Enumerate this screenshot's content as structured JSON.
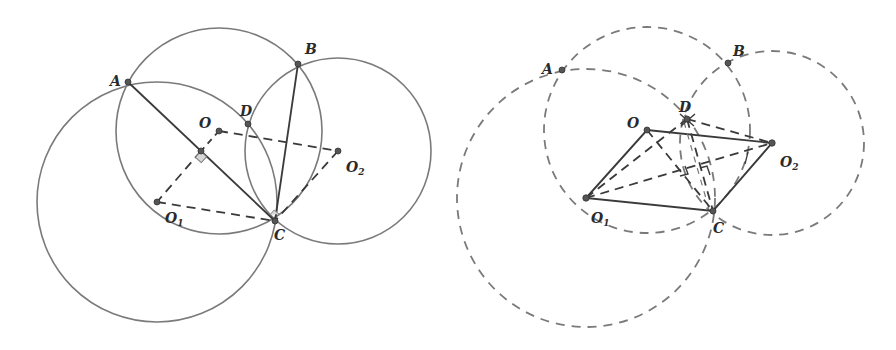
{
  "colors": {
    "stroke": "#7a7a7a",
    "solid": "#3a3a3a",
    "point": "#555555",
    "label": "#2a2a2a"
  },
  "left_figure": {
    "labels": {
      "A": "A",
      "B": "B",
      "C": "C",
      "D": "D",
      "O": "O",
      "O1": "O",
      "O1_sub": "1",
      "O2": "O",
      "O2_sub": "2"
    },
    "points": {
      "A": [
        128,
        82
      ],
      "B": [
        298,
        64
      ],
      "C": [
        275,
        221
      ],
      "D": [
        248,
        124
      ],
      "O": [
        219,
        131
      ],
      "O1": [
        157,
        202
      ],
      "O2": [
        338,
        151
      ],
      "M": [
        201,
        151
      ]
    },
    "circles": [
      {
        "name": "circle-O",
        "cx": 219,
        "cy": 131,
        "r": 103,
        "style": "solid"
      },
      {
        "name": "circle-O1",
        "cx": 157,
        "cy": 202,
        "r": 120,
        "style": "solid"
      },
      {
        "name": "circle-O2",
        "cx": 338,
        "cy": 151,
        "r": 93,
        "style": "solid"
      }
    ]
  },
  "right_figure": {
    "labels": {
      "A": "A",
      "B": "B",
      "C": "C",
      "D": "D",
      "O": "O",
      "O1": "O",
      "O1_sub": "1",
      "O2": "O",
      "O2_sub": "2"
    },
    "points": {
      "A": [
        562,
        70
      ],
      "B": [
        728,
        63
      ],
      "C": [
        713,
        211
      ],
      "D": [
        687,
        119
      ],
      "O": [
        647,
        130
      ],
      "O1": [
        586,
        198
      ],
      "O2": [
        772,
        143
      ]
    },
    "circles": [
      {
        "name": "circle-O",
        "cx": 647,
        "cy": 130,
        "r": 103,
        "style": "dashed"
      },
      {
        "name": "circle-O1",
        "cx": 586,
        "cy": 198,
        "r": 129,
        "style": "dashed"
      },
      {
        "name": "circle-O2",
        "cx": 772,
        "cy": 143,
        "r": 92,
        "style": "dashed"
      }
    ]
  }
}
